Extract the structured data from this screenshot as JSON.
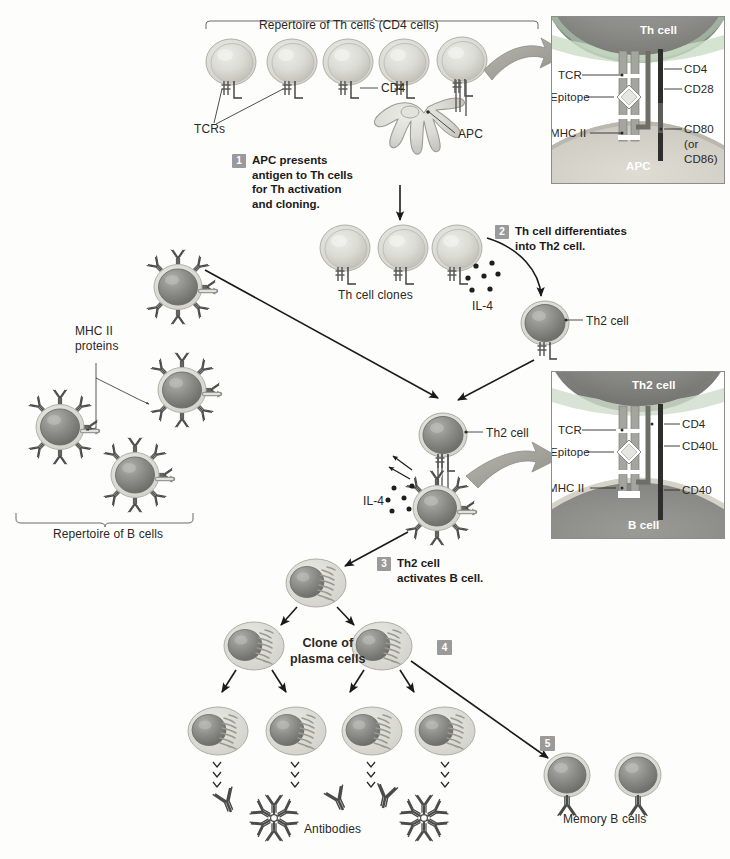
{
  "figure": {
    "background": "#fdfdfc",
    "ink": "#231f20"
  },
  "colors": {
    "cell_light": "#d9d9d4",
    "cell_light_edge": "#b3b3ac",
    "cell_dark": "#8f8f8c",
    "cell_dark_edge": "#6f6f6c",
    "cytoplasm": "#cfcfc8",
    "badge_gray": "#9a9a9a",
    "inset_border": "#8d8d8d",
    "arrow": "#1a1a1a",
    "receptor_dark": "#4a4a4a",
    "receptor_mid": "#8a8a8a"
  },
  "top": {
    "repertoire_label": "Repertoire of Th cells (CD4 cells)",
    "tcr_label": "TCRs",
    "cd4_label": "CD4",
    "apc_label": "APC",
    "th_cell_count": 5
  },
  "steps": [
    {
      "num": "1",
      "text": "APC presents\nantigen to Th cells\nfor Th activation\nand cloning."
    },
    {
      "num": "2",
      "text": "Th cell differentiates\ninto Th2 cell."
    },
    {
      "num": "3",
      "text": "Th2 cell\nactivates B cell."
    },
    {
      "num": "4",
      "text": ""
    },
    {
      "num": "5",
      "text": ""
    }
  ],
  "middle": {
    "clones_label": "Th cell clones",
    "il4_label": "IL-4",
    "th2_label": "Th2 cell",
    "clone_count": 3
  },
  "left": {
    "mhc_label": "MHC II\nproteins",
    "repertoire_b_label": "Repertoire of B cells",
    "b_cell_count": 4
  },
  "center": {
    "th2_label": "Th2 cell",
    "il4_label": "IL-4"
  },
  "bottom": {
    "clone_label": "Clone of\nplasma cells",
    "antibodies_label": "Antibodies",
    "memory_label": "Memory B cells",
    "plasma_gen2": 2,
    "plasma_gen3": 4,
    "memory_count": 2
  },
  "inset_top": {
    "top_cell": "Th cell",
    "bottom_cell": "APC",
    "left_labels": [
      "TCR",
      "Epitope",
      "MHC II"
    ],
    "right_labels": [
      "CD4",
      "CD28",
      "CD80\n(or\nCD86)"
    ]
  },
  "inset_bottom": {
    "top_cell": "Th2 cell",
    "bottom_cell": "B cell",
    "left_labels": [
      "TCR",
      "Epitope",
      "MHC II"
    ],
    "right_labels": [
      "CD4",
      "CD40L",
      "CD40"
    ]
  }
}
